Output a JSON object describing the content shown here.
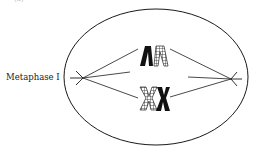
{
  "diagram": {
    "title_fragment": "(a)",
    "stage_label": "Metaphase I",
    "components": {
      "cell": "cell-membrane-ellipse",
      "poles": [
        "left-spindle-pole",
        "right-spindle-pole"
      ],
      "spindle_fibers": 6,
      "chromosome_pairs": [
        {
          "name": "homologous-pair-top",
          "shape": "inverted-V",
          "members": [
            "solid-black",
            "checkered"
          ]
        },
        {
          "name": "homologous-pair-bottom",
          "shape": "X",
          "members": [
            "checkered",
            "solid-black"
          ]
        }
      ]
    },
    "colors": {
      "line": "#1a1a1a",
      "background": "#ffffff"
    }
  }
}
